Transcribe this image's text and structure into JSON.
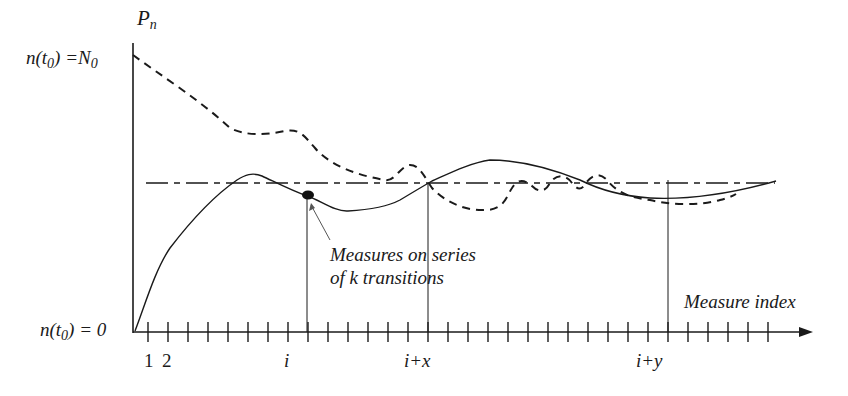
{
  "diagram": {
    "y_axis_label": "P",
    "y_axis_label_sub": "n",
    "y_top_label_prefix": "n(t",
    "y_top_label_sub": "0",
    "y_top_label_suffix": ") =N",
    "y_top_label_sub2": "0",
    "y_bottom_label_prefix": "n(t",
    "y_bottom_label_sub": "0",
    "y_bottom_label_suffix": ") = 0",
    "x_axis_label": "Measure index",
    "annotation_line1": "Measures on series",
    "annotation_line2": "of k transitions",
    "tick_labels": {
      "one": "1",
      "two": "2",
      "i": "i",
      "i_plus_x": "i+x",
      "i_plus_y": "i+y"
    },
    "tick_count": 32,
    "colors": {
      "ink": "#1a1a1a",
      "background": "#ffffff"
    },
    "series": [
      {
        "name": "dashed-curve",
        "style": "dashed",
        "description": "starts at N0 and decays, oscillating around the equilibrium line"
      },
      {
        "name": "solid-curve",
        "style": "solid",
        "description": "starts at 0, rises and oscillates around the equilibrium line"
      },
      {
        "name": "equilibrium-line",
        "style": "dash-dot",
        "description": "horizontal reference level"
      }
    ],
    "marked_indices": [
      "i",
      "i+x",
      "i+y"
    ]
  }
}
